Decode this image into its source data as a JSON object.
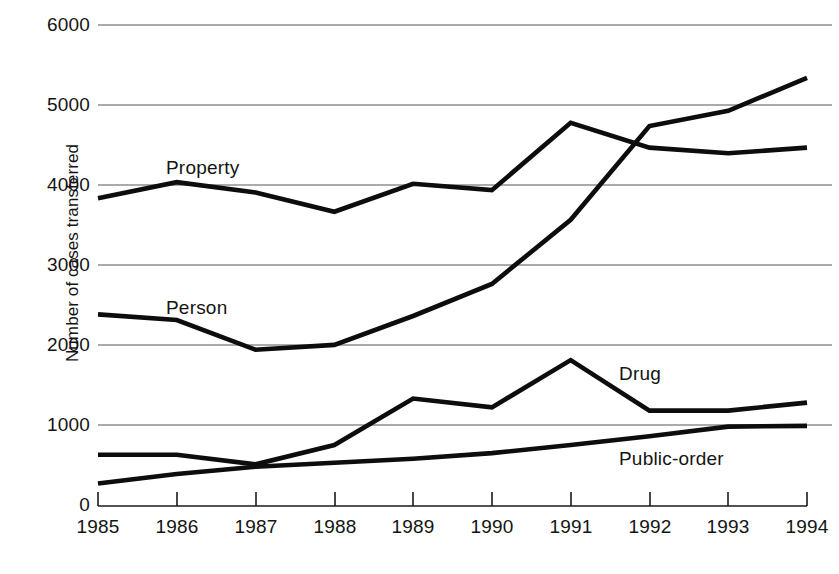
{
  "chart_data": {
    "type": "line",
    "title": "",
    "xlabel": "",
    "ylabel": "Number of cases transferred",
    "categories": [
      "1985",
      "1986",
      "1987",
      "1988",
      "1989",
      "1990",
      "1991",
      "1992",
      "1993",
      "1994"
    ],
    "x": [
      1985,
      1986,
      1987,
      1988,
      1989,
      1990,
      1991,
      1992,
      1993,
      1994
    ],
    "xlim": [
      1985,
      1994
    ],
    "ylim": [
      0,
      6000
    ],
    "yticks": [
      0,
      1000,
      2000,
      3000,
      4000,
      5000,
      6000
    ],
    "ytick_labels": [
      "0",
      "1000",
      "2000",
      "3000",
      "4000",
      "5000",
      "6000"
    ],
    "grid": "horizontal",
    "legend": "inline-labels",
    "series": [
      {
        "name": "Property",
        "label": "Property",
        "values": [
          3840,
          4040,
          3910,
          3670,
          4020,
          3940,
          4780,
          4470,
          4400,
          4470
        ]
      },
      {
        "name": "Person",
        "label": "Person",
        "values": [
          2390,
          2320,
          1950,
          2010,
          2370,
          2770,
          3570,
          4740,
          4930,
          5340
        ]
      },
      {
        "name": "Drug",
        "label": "Drug",
        "values": [
          640,
          640,
          520,
          760,
          1340,
          1230,
          1820,
          1190,
          1190,
          1290
        ]
      },
      {
        "name": "Public-order",
        "label": "Public-order",
        "values": [
          280,
          400,
          490,
          540,
          590,
          660,
          760,
          870,
          990,
          1000
        ]
      }
    ],
    "colors": {
      "series_stroke": "#0d0d0d",
      "gridline": "#58585a",
      "axis": "#1a1a1a",
      "text": "#141414",
      "background": "#ffffff"
    }
  },
  "axis": {
    "y_title": "Number of cases transferred",
    "y_ticks": [
      "6000",
      "5000",
      "4000",
      "3000",
      "2000",
      "1000",
      "0"
    ],
    "x_ticks": [
      "1985",
      "1986",
      "1987",
      "1988",
      "1989",
      "1990",
      "1991",
      "1992",
      "1993",
      "1994"
    ]
  },
  "series_labels": {
    "property": "Property",
    "person": "Person",
    "drug": "Drug",
    "public_order": "Public-order"
  }
}
